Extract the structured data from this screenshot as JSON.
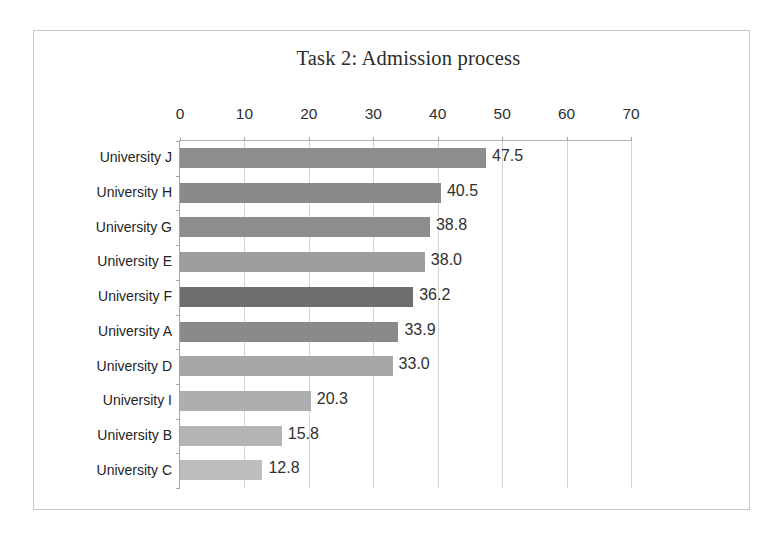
{
  "chart_data": {
    "type": "bar",
    "orientation": "horizontal",
    "title": "Task 2: Admission process",
    "xlabel": "",
    "ylabel": "",
    "xlim": [
      0,
      70
    ],
    "xticks": [
      0,
      10,
      20,
      30,
      40,
      50,
      60,
      70
    ],
    "grid": true,
    "legend": false,
    "categories": [
      "University J",
      "University H",
      "University G",
      "University E",
      "University F",
      "University A",
      "University D",
      "University I",
      "University B",
      "University C"
    ],
    "values": [
      47.5,
      40.5,
      38.8,
      38.0,
      36.2,
      33.9,
      33.0,
      20.3,
      15.8,
      12.8
    ],
    "data_labels": [
      "47.5",
      "40.5",
      "38.8",
      "38.0",
      "36.2",
      "33.9",
      "33.0",
      "20.3",
      "15.8",
      "12.8"
    ],
    "bar_colors": [
      "#8d8d8d",
      "#8a8a8a",
      "#8d8d8d",
      "#9e9e9e",
      "#6e6e6e",
      "#8a8a8a",
      "#a7a7a7",
      "#aeaeae",
      "#b4b4b4",
      "#bdbdbd"
    ]
  },
  "style": {
    "frame_color": "#c9c9c9",
    "grid_color": "#d4d4d4",
    "axis_color": "#a6a6a6",
    "title_color": "#2b2b2b",
    "label_color": "#232323",
    "value_color": "#303030",
    "background": "#ffffff"
  }
}
